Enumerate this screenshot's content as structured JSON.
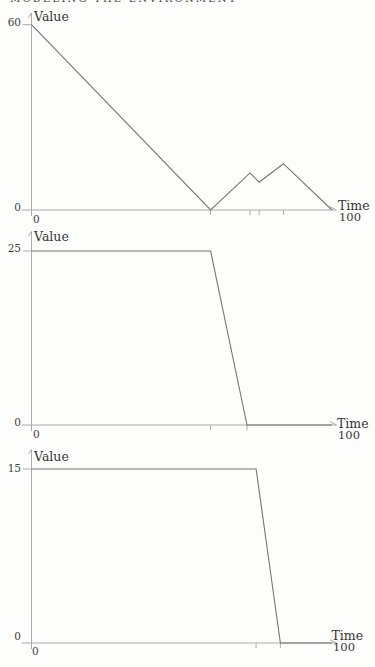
{
  "page": {
    "background": "#fdfdfc"
  },
  "header": {
    "text": "MODELING THE ENVIRONMENT"
  },
  "style": {
    "line_color": "#757575",
    "axis_color": "#ababab",
    "text_color": "#3a3a3a",
    "background": "#fdfdfc"
  },
  "chart_data": [
    {
      "type": "line",
      "title": "",
      "ylabel": "Value",
      "xlabel": "Time",
      "xlim": [
        0,
        100
      ],
      "ylim": [
        0,
        60
      ],
      "grid": false,
      "legend": null,
      "points": [
        [
          0,
          60
        ],
        [
          59,
          0
        ],
        [
          72,
          12
        ],
        [
          75,
          9
        ],
        [
          83,
          15
        ],
        [
          99,
          0
        ]
      ],
      "x_minor_ticks": [
        59,
        72,
        75,
        83
      ],
      "labels": {
        "ymax": "60",
        "yzero": "0",
        "xzero": "0",
        "xmax": "100"
      }
    },
    {
      "type": "line",
      "title": "",
      "ylabel": "Value",
      "xlabel": "Time",
      "xlim": [
        0,
        100
      ],
      "ylim": [
        0,
        25
      ],
      "grid": false,
      "legend": null,
      "points": [
        [
          0,
          25
        ],
        [
          59,
          25
        ],
        [
          71,
          0
        ],
        [
          99,
          0
        ]
      ],
      "x_minor_ticks": [
        59,
        71
      ],
      "labels": {
        "ymax": "25",
        "yzero": "0",
        "xzero": "0",
        "xmax": "100"
      }
    },
    {
      "type": "line",
      "title": "",
      "ylabel": "Value",
      "xlabel": "Time",
      "xlim": [
        0,
        100
      ],
      "ylim": [
        0,
        15
      ],
      "grid": false,
      "legend": null,
      "points": [
        [
          0,
          15
        ],
        [
          74,
          15
        ],
        [
          82,
          0
        ],
        [
          99,
          0
        ]
      ],
      "x_minor_ticks": [
        74,
        82
      ],
      "labels": {
        "ymax": "15",
        "yzero": "0",
        "xzero": "0",
        "xmax": "100"
      }
    }
  ]
}
